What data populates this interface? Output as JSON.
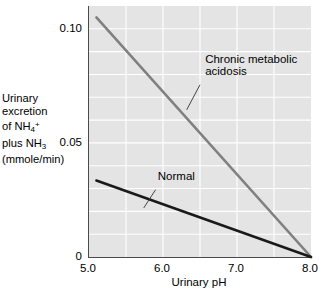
{
  "chart_data": {
    "type": "line",
    "title": "",
    "xlabel": "Urinary pH",
    "ylabel_lines": [
      "Urinary",
      "excretion",
      "of NH4+",
      "plus NH3",
      "(mmole/min)"
    ],
    "ylabel_plain": "Urinary excretion of NH4+ plus NH3 (mmole/min)",
    "xlim": [
      5.0,
      8.0
    ],
    "ylim": [
      0,
      0.11
    ],
    "xticks": [
      5.0,
      6.0,
      7.0,
      8.0
    ],
    "xtick_labels": [
      "5.0",
      "6.0",
      "7.0",
      "8.0"
    ],
    "yticks": [
      0,
      0.05,
      0.1
    ],
    "ytick_labels": [
      "0",
      "0.05",
      "0.10"
    ],
    "grid": true,
    "grid_color": "#ffffff",
    "grid_x_minor": [
      5.5,
      6.0,
      6.5,
      7.0,
      7.5
    ],
    "grid_y_minor": [
      0.01,
      0.02,
      0.03,
      0.04,
      0.05,
      0.06,
      0.07,
      0.08,
      0.09,
      0.1
    ],
    "plot_background": "#e4e4e4",
    "legend_position": "inline-annotations",
    "series": [
      {
        "name": "Chronic metabolic acidosis",
        "color": "#808080",
        "width": 2.6,
        "x": [
          5.1,
          8.0
        ],
        "y": [
          0.105,
          0.0
        ]
      },
      {
        "name": "Normal",
        "color": "#1a1a1a",
        "width": 2.6,
        "x": [
          5.1,
          8.0
        ],
        "y": [
          0.0335,
          0.0
        ]
      }
    ],
    "annotations": [
      {
        "label_lines": [
          "Chronic metabolic",
          "acidosis"
        ],
        "text_x": 6.57,
        "text_y": 0.0785,
        "leader_from_x": 6.5,
        "leader_from_y": 0.0755,
        "leader_to_x": 6.32,
        "leader_to_y": 0.0645
      },
      {
        "label_lines": [
          "Normal"
        ],
        "text_x": 5.93,
        "text_y": 0.0325,
        "leader_from_x": 5.9,
        "leader_from_y": 0.0295,
        "leader_to_x": 5.74,
        "leader_to_y": 0.0215
      }
    ]
  }
}
